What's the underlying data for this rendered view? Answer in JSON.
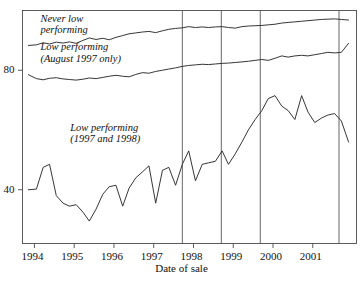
{
  "chart_data": {
    "type": "line",
    "title": "",
    "xlabel": "Date of sale",
    "ylabel": "",
    "xlim": [
      1993.7,
      2002.1
    ],
    "ylim": [
      22,
      100
    ],
    "grid": false,
    "legend_position": "inline-annotations",
    "x_ticks": [
      1994,
      1995,
      1996,
      1997,
      1998,
      1999,
      2000,
      2001
    ],
    "x_tick_labels": [
      "1994",
      "1995",
      "1996",
      "1997",
      "1998",
      "1999",
      "2000",
      "2001"
    ],
    "y_ticks": [
      40,
      80
    ],
    "y_tick_labels": [
      "40",
      "80"
    ],
    "annotations": [
      {
        "name": "never-low-performing",
        "text_lines": [
          "Never low",
          "performing"
        ],
        "x": 1994.15,
        "y": 95.5
      },
      {
        "name": "low-performing-august-1997-only",
        "text_lines": [
          "Low performing",
          "(August 1997 only)"
        ],
        "x": 1994.15,
        "y": 86.0
      },
      {
        "name": "low-performing-1997-and-1998",
        "text_lines": [
          "Low performing",
          "(1997 and 1998)"
        ],
        "x": 1994.9,
        "y": 59.0
      }
    ],
    "vertical_reference_lines": [
      1997.72,
      1998.7,
      1999.68,
      2001.66
    ],
    "series": [
      {
        "name": "Never low performing",
        "x": [
          1993.85,
          1994.05,
          1994.22,
          1994.38,
          1994.55,
          1994.72,
          1994.88,
          1995.05,
          1995.22,
          1995.38,
          1995.55,
          1995.72,
          1995.88,
          1996.05,
          1996.22,
          1996.38,
          1996.55,
          1996.72,
          1996.88,
          1997.05,
          1997.22,
          1997.38,
          1997.55,
          1997.72,
          1997.88,
          1998.05,
          1998.22,
          1998.38,
          1998.55,
          1998.72,
          1998.88,
          1999.05,
          1999.22,
          1999.38,
          1999.55,
          1999.72,
          1999.88,
          2000.05,
          2000.22,
          2000.38,
          2000.55,
          2000.72,
          2000.88,
          2001.05,
          2001.22,
          2001.38,
          2001.55,
          2001.72,
          2001.9
        ],
        "values": [
          88.3,
          88.5,
          89.2,
          88.8,
          89.4,
          89.1,
          89.5,
          89.0,
          90.0,
          90.8,
          90.3,
          90.7,
          90.2,
          91.0,
          91.6,
          92.2,
          92.5,
          92.8,
          93.0,
          92.6,
          93.2,
          93.7,
          94.0,
          94.2,
          94.6,
          94.3,
          94.5,
          94.3,
          94.5,
          94.6,
          94.3,
          94.1,
          94.6,
          94.8,
          94.9,
          95.0,
          95.2,
          95.4,
          95.8,
          96.0,
          96.2,
          96.4,
          96.6,
          96.8,
          97.0,
          97.1,
          97.2,
          97.0,
          96.8
        ]
      },
      {
        "name": "Low performing (August 1997 only)",
        "x": [
          1993.85,
          1994.05,
          1994.22,
          1994.38,
          1994.55,
          1994.72,
          1994.88,
          1995.05,
          1995.22,
          1995.38,
          1995.55,
          1995.72,
          1995.88,
          1996.05,
          1996.22,
          1996.38,
          1996.55,
          1996.72,
          1996.88,
          1997.05,
          1997.22,
          1997.38,
          1997.55,
          1997.72,
          1997.88,
          1998.05,
          1998.22,
          1998.38,
          1998.55,
          1998.72,
          1998.88,
          1999.05,
          1999.22,
          1999.38,
          1999.55,
          1999.72,
          1999.88,
          2000.05,
          2000.22,
          2000.38,
          2000.55,
          2000.72,
          2000.88,
          2001.05,
          2001.22,
          2001.38,
          2001.55,
          2001.72,
          2001.9
        ],
        "values": [
          78.5,
          77.2,
          76.8,
          77.3,
          77.5,
          77.1,
          76.9,
          76.7,
          77.0,
          77.4,
          77.2,
          77.6,
          78.0,
          78.3,
          78.0,
          77.8,
          78.6,
          79.2,
          79.0,
          79.6,
          80.0,
          80.4,
          80.8,
          81.3,
          81.6,
          81.8,
          82.0,
          81.9,
          82.1,
          82.3,
          82.4,
          82.6,
          82.8,
          83.0,
          83.3,
          83.6,
          83.3,
          84.0,
          84.8,
          84.4,
          84.8,
          85.0,
          84.8,
          85.2,
          85.6,
          86.0,
          85.8,
          86.0,
          89.0
        ]
      },
      {
        "name": "Low performing (1997 and 1998)",
        "x": [
          1993.85,
          1994.05,
          1994.22,
          1994.38,
          1994.55,
          1994.72,
          1994.88,
          1995.05,
          1995.22,
          1995.38,
          1995.55,
          1995.72,
          1995.88,
          1996.05,
          1996.22,
          1996.38,
          1996.55,
          1996.72,
          1996.88,
          1997.05,
          1997.22,
          1997.38,
          1997.55,
          1997.72,
          1997.88,
          1998.05,
          1998.22,
          1998.38,
          1998.55,
          1998.72,
          1998.88,
          1999.05,
          1999.22,
          1999.38,
          1999.55,
          1999.72,
          1999.88,
          2000.05,
          2000.22,
          2000.38,
          2000.55,
          2000.72,
          2000.88,
          2001.05,
          2001.22,
          2001.38,
          2001.55,
          2001.72,
          2001.9
        ],
        "values": [
          40.0,
          40.2,
          47.5,
          48.5,
          38.0,
          35.5,
          34.5,
          35.0,
          32.5,
          29.5,
          33.5,
          38.5,
          41.0,
          41.5,
          34.5,
          40.5,
          44.0,
          46.0,
          48.0,
          35.5,
          46.5,
          47.5,
          41.5,
          48.5,
          53.0,
          43.0,
          48.5,
          49.0,
          49.5,
          53.0,
          48.5,
          52.0,
          56.0,
          60.0,
          63.5,
          66.5,
          70.5,
          71.5,
          68.0,
          66.5,
          63.5,
          71.5,
          66.0,
          62.5,
          64.0,
          65.0,
          65.5,
          63.0,
          56.0
        ]
      }
    ]
  }
}
